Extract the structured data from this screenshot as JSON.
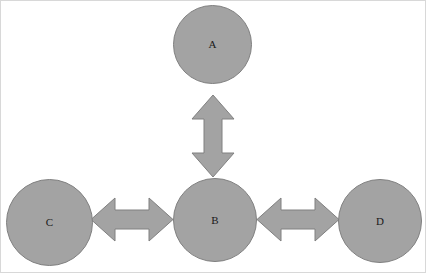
{
  "diagram": {
    "background_color": "#ffffff",
    "frame_border_color": "#d8d8d8",
    "node_fill_color": "#a3a3a3",
    "node_border_color": "#808080",
    "arrow_fill_color": "#a3a3a3",
    "arrow_border_color": "#808080",
    "label_color": "#1a1a1a",
    "nodes": [
      {
        "id": "a",
        "label": "A",
        "shape": "circle",
        "x": 172,
        "y": 4,
        "diameter": 79,
        "position": "top-center"
      },
      {
        "id": "b",
        "label": "B",
        "shape": "circle",
        "x": 172,
        "y": 177,
        "diameter": 84,
        "position": "center"
      },
      {
        "id": "c",
        "label": "C",
        "shape": "circle",
        "x": 5,
        "y": 178,
        "diameter": 87,
        "position": "left"
      },
      {
        "id": "d",
        "label": "D",
        "shape": "circle",
        "x": 337,
        "y": 178,
        "diameter": 84,
        "position": "right"
      }
    ],
    "connectors": [
      {
        "id": "a-b",
        "from": "a",
        "to": "b",
        "style": "double-headed-block-arrow",
        "orientation": "vertical",
        "x": 190,
        "y": 93,
        "width": 44,
        "height": 84
      },
      {
        "id": "c-b",
        "from": "c",
        "to": "b",
        "style": "double-headed-block-arrow",
        "orientation": "horizontal",
        "x": 89,
        "y": 196,
        "width": 84,
        "height": 45
      },
      {
        "id": "b-d",
        "from": "b",
        "to": "d",
        "style": "double-headed-block-arrow",
        "orientation": "horizontal",
        "x": 255,
        "y": 196,
        "width": 84,
        "height": 45
      }
    ]
  }
}
